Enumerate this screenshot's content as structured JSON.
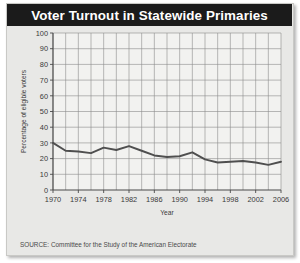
{
  "title": "Voter Turnout in Statewide Primaries",
  "source_note": "SOURCE: Committee for the Study of the American Electorate",
  "colors": {
    "title_bar": "#1b1b1b",
    "title_text": "#ffffff",
    "card_background": "#e8e8e6",
    "plot_background": "#f2f2f0",
    "grid": "#8c8c8c",
    "axis": "#4a4a4a",
    "line": "#4f4f4f",
    "tick_text": "#3a3a3a"
  },
  "chart_data": {
    "type": "line",
    "title": "Voter Turnout in Statewide Primaries",
    "xlabel": "Year",
    "ylabel": "Percentage of eligible voters",
    "xlim": [
      1970,
      2006
    ],
    "ylim": [
      0,
      100
    ],
    "grid": true,
    "legend": "none",
    "y_ticks": [
      0,
      10,
      20,
      30,
      40,
      50,
      60,
      70,
      80,
      90,
      100
    ],
    "x_ticks": [
      1970,
      1974,
      1978,
      1982,
      1986,
      1990,
      1994,
      1998,
      2002,
      2006
    ],
    "x_gridline_step": 2,
    "x": [
      1970,
      1972,
      1974,
      1976,
      1978,
      1980,
      1982,
      1984,
      1986,
      1988,
      1990,
      1992,
      1994,
      1996,
      1998,
      2000,
      2002,
      2004,
      2006
    ],
    "values": [
      30,
      25,
      24.5,
      23.5,
      27,
      25.5,
      28,
      25,
      22,
      21,
      21.5,
      24,
      19.5,
      17.5,
      18,
      18.5,
      17.5,
      16,
      18
    ]
  }
}
